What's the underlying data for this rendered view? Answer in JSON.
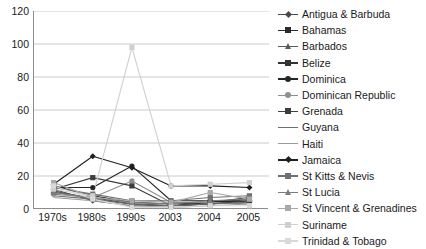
{
  "chart_data": {
    "type": "line",
    "title": "",
    "xlabel": "",
    "ylabel": "",
    "categories": [
      "1970s",
      "1980s",
      "1990s",
      "2003",
      "2004",
      "2005"
    ],
    "ylim": [
      0,
      120
    ],
    "yticks": [
      0,
      20,
      40,
      60,
      80,
      100,
      120
    ],
    "grid": "horizontal",
    "legend_position": "right",
    "series": [
      {
        "name": "Antigua & Barbuda",
        "color": "#4a4a4a",
        "marker": "diamond",
        "values": [
          12,
          5,
          2,
          2,
          3,
          5
        ]
      },
      {
        "name": "Bahamas",
        "color": "#2b2b2b",
        "marker": "square",
        "values": [
          14,
          8,
          4,
          3,
          4,
          7
        ]
      },
      {
        "name": "Barbados",
        "color": "#5a5a5a",
        "marker": "tri",
        "values": [
          11,
          6,
          3,
          2,
          3,
          6
        ]
      },
      {
        "name": "Belize",
        "color": "#333333",
        "marker": "square",
        "values": [
          10,
          7,
          3,
          2,
          4,
          6
        ]
      },
      {
        "name": "Dominica",
        "color": "#262626",
        "marker": "circle",
        "values": [
          13,
          13,
          26,
          5,
          5,
          4
        ]
      },
      {
        "name": "Dominican Republic",
        "color": "#8f8f8f",
        "marker": "circle",
        "values": [
          9,
          7,
          17,
          4,
          4,
          3
        ]
      },
      {
        "name": "Grenada",
        "color": "#3d3d3d",
        "marker": "square",
        "values": [
          12,
          19,
          14,
          2,
          3,
          5
        ]
      },
      {
        "name": "Guyana",
        "color": "#6e6e6e",
        "marker": "none",
        "values": [
          8,
          6,
          3,
          2,
          3,
          4
        ]
      },
      {
        "name": "Haiti",
        "color": "#9a9a9a",
        "marker": "none",
        "values": [
          7,
          5,
          2,
          1,
          2,
          3
        ]
      },
      {
        "name": "Jamaica",
        "color": "#1f1f1f",
        "marker": "diamond",
        "values": [
          15,
          32,
          25,
          14,
          14,
          13
        ]
      },
      {
        "name": "St Kitts & Nevis",
        "color": "#707070",
        "marker": "square",
        "values": [
          13,
          9,
          5,
          5,
          7,
          8
        ]
      },
      {
        "name": "St Lucia",
        "color": "#7d7d7d",
        "marker": "tri",
        "values": [
          10,
          7,
          4,
          3,
          5,
          6
        ]
      },
      {
        "name": "St Vincent & Grenadines",
        "color": "#a8a8a8",
        "marker": "square",
        "values": [
          16,
          7,
          5,
          4,
          10,
          6
        ]
      },
      {
        "name": "Suriname",
        "color": "#cfcfcf",
        "marker": "square",
        "values": [
          12,
          8,
          98,
          14,
          15,
          16
        ]
      },
      {
        "name": "Trinidad & Tobago",
        "color": "#d9d9d9",
        "marker": "square",
        "values": [
          14,
          6,
          1,
          1,
          2,
          2
        ]
      }
    ],
    "colors": {
      "axis": "#8c8c8c",
      "grid": "#bdbdbd",
      "text": "#1a1a1a",
      "background": "#ffffff"
    }
  }
}
